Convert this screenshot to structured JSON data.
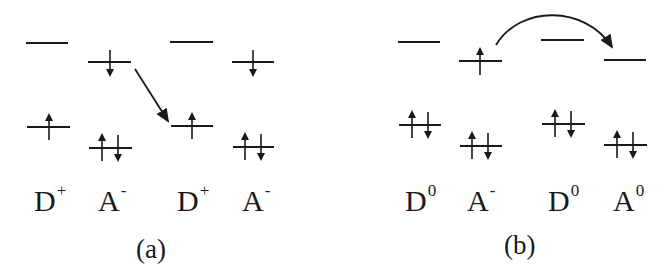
{
  "panels": [
    {
      "caption": "(a)",
      "sites": [
        {
          "base": "D",
          "charge": "+",
          "upper": "empty",
          "lower": "up"
        },
        {
          "base": "A",
          "charge": "-",
          "upper": "down",
          "lower": "up-down"
        },
        {
          "base": "D",
          "charge": "+",
          "upper": "empty",
          "lower": "up"
        },
        {
          "base": "A",
          "charge": "-",
          "upper": "down",
          "lower": "up-down"
        }
      ],
      "transition": "straight arrow from A- upper level to neighboring D+ lower level"
    },
    {
      "caption": "(b)",
      "sites": [
        {
          "base": "D",
          "charge": "0",
          "upper": "empty",
          "lower": "up-down"
        },
        {
          "base": "A",
          "charge": "-",
          "upper": "up",
          "lower": "up-down"
        },
        {
          "base": "D",
          "charge": "0",
          "upper": "empty",
          "lower": "up-down"
        },
        {
          "base": "A",
          "charge": "0",
          "upper": "empty",
          "lower": "up-down"
        }
      ],
      "transition": "curved arrow from A- upper level to A0 upper level"
    }
  ],
  "colors": {
    "ink": "#1a1a1a",
    "background": "#ffffff"
  }
}
